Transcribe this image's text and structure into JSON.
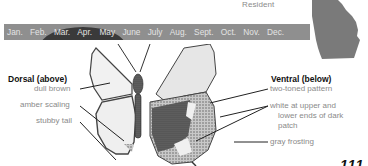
{
  "range": {
    "status_label": "Resident",
    "map_icon": "georgia-state-map-icon"
  },
  "flight_period": {
    "months": [
      "Jan.",
      "Feb.",
      "Mar.",
      "Apr.",
      "May",
      "June",
      "July",
      "Aug.",
      "Sept.",
      "Oct.",
      "Nov.",
      "Dec."
    ],
    "bar_color": "#8f8f8f",
    "peak_color": "#3a3a3a",
    "peak_span": "Feb.–May"
  },
  "dorsal": {
    "heading": "Dorsal (above)",
    "labels": [
      "dull brown",
      "amber scaling",
      "stubby tail"
    ]
  },
  "ventral": {
    "heading": "Ventral (below)",
    "labels": [
      "two-toned pattern",
      "white at upper and",
      "lower ends of dark",
      "patch",
      "gray frosting"
    ]
  },
  "page": {
    "number_partial": "111"
  }
}
